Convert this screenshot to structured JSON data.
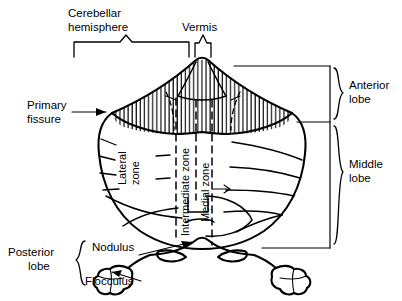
{
  "figure": {
    "background_color": "#ffffff",
    "line_color": "#000000"
  },
  "labels": {
    "cerebellar_hemisphere_line1": "Cerebellar",
    "cerebellar_hemisphere_line2": "hemisphere",
    "vermis": "Vermis",
    "anterior_lobe_line1": "Anterior",
    "anterior_lobe_line2": "lobe",
    "middle_lobe_line1": "Middle",
    "middle_lobe_line2": "lobe",
    "primary_fissure_line1": "Primary",
    "primary_fissure_line2": "fissure",
    "posterior_lobe_line1": "Posterior",
    "posterior_lobe_line2": "lobe",
    "nodulus": "Nodulus",
    "flocculus": "Flocculus",
    "lateral_zone_line1": "Lateral",
    "lateral_zone_line2": "zone",
    "intermediate_zone": "Intermediate zone",
    "medial_zone": "Medial zone"
  }
}
